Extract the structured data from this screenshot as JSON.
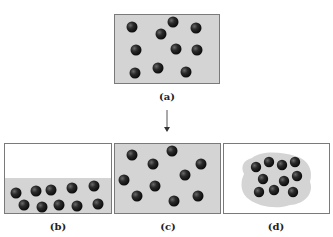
{
  "panels": [
    {
      "id": "a",
      "label": "(a)",
      "description": "gas-like particles evenly spread, box filled gray"
    },
    {
      "id": "b",
      "label": "(b)",
      "description": "liquid-like particles settled at bottom of container"
    },
    {
      "id": "c",
      "label": "(c)",
      "description": "gas particles filling entire container"
    },
    {
      "id": "d",
      "label": "(d)",
      "description": "solid-like cluster of particles in shaded blob"
    }
  ],
  "arrow": {
    "direction": "down"
  },
  "colors": {
    "fill": "#d4d4d4",
    "border": "#7a7a7a",
    "particle": "#1e1e1e"
  }
}
